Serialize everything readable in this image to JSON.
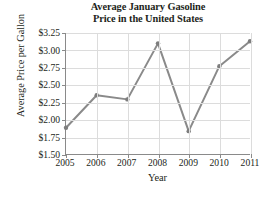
{
  "chart_data": {
    "type": "line",
    "title": "Average January Gasoline Price in the United States",
    "title_lines": [
      "Average January Gasoline",
      "Price in the United States"
    ],
    "xlabel": "Year",
    "ylabel": "Average Price per Gallon",
    "categories": [
      "2005",
      "2006",
      "2007",
      "2008",
      "2009",
      "2010",
      "2011"
    ],
    "x": [
      2005,
      2006,
      2007,
      2008,
      2009,
      2010,
      2011
    ],
    "values": [
      1.88,
      2.35,
      2.29,
      3.1,
      1.83,
      2.77,
      3.13
    ],
    "point_labels": [
      "$1.88",
      "$2.35",
      "$2.29",
      "$3.10",
      "$1.83",
      "$2.77",
      "$3.13"
    ],
    "ylim": [
      1.5,
      3.25
    ],
    "xlim": [
      2005,
      2011
    ],
    "ytick_labels": [
      "$3.25",
      "$3.00",
      "$2.75",
      "$2.50",
      "$2.25",
      "$2.00",
      "$1.75",
      "$1.50"
    ],
    "ytick_values": [
      3.25,
      3.0,
      2.75,
      2.5,
      2.25,
      2.0,
      1.75,
      1.5
    ],
    "xtick_labels": [
      "2005",
      "2006",
      "2007",
      "2008",
      "2009",
      "2010",
      "2011"
    ],
    "grid": true,
    "legend": false,
    "legend_position": "none",
    "series": [
      {
        "name": "Average January Gasoline Price",
        "values": [
          1.88,
          2.35,
          2.29,
          3.1,
          1.83,
          2.77,
          3.13
        ]
      }
    ],
    "colors": {
      "line": "#8a8a8a",
      "marker": "#7d7d7d",
      "grid": "#dcdcdc",
      "axis": "#8a8a8a",
      "text": "#231f20",
      "background": "#ffffff"
    }
  }
}
